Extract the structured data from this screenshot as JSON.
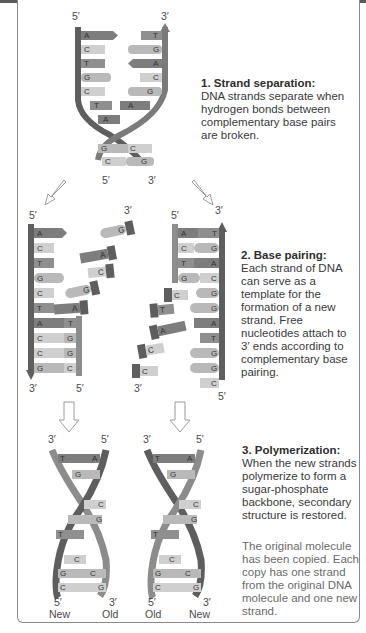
{
  "steps": [
    {
      "title": "1. Strand separation:",
      "body": "DNA strands separate when hydrogen bonds between complementary base pairs are broken."
    },
    {
      "title": "2. Base pairing:",
      "body": "Each strand of DNA can serve as a template for the formation of a new strand. Free nucleotides attach to 3′ ends according to complementary base pairing."
    },
    {
      "title": "3. Polymerization:",
      "body": "When the new strands polymerize to form a sugar-phosphate backbone, secondary structure is restored."
    }
  ],
  "conclusion": "The original molecule has been copied. Each copy has one strand from the original DNA molecule and one new strand.",
  "labels": {
    "five_prime": "5′",
    "three_prime": "3′",
    "new": "New",
    "old": "Old"
  },
  "sequences": {
    "template_left": [
      "A",
      "C",
      "T",
      "G",
      "C",
      "T",
      "A",
      "C",
      "C",
      "G"
    ],
    "template_right": [
      "T",
      "G",
      "A",
      "C",
      "G",
      "A",
      "T",
      "G",
      "G",
      "C"
    ]
  },
  "colors": {
    "A": "#7d7d7d",
    "T": "#8f8f8f",
    "G": "#b9b9b9",
    "C": "#cfcfcf",
    "backbone": "#5e5e5e",
    "backbone_new": "#8c8c8c"
  }
}
